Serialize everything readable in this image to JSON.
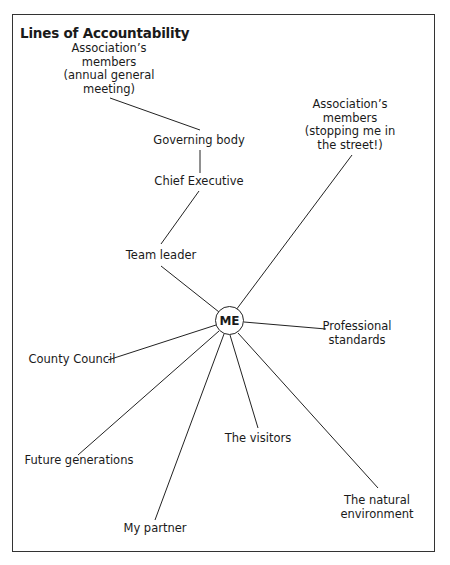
{
  "diagram": {
    "title": "Lines of Accountability",
    "center": "ME",
    "nodes": {
      "agm": [
        "Association’s",
        "members",
        "(annual general",
        "meeting)"
      ],
      "governing_body": "Governing body",
      "chief_executive": "Chief Executive",
      "team_leader": "Team leader",
      "street": [
        "Association’s",
        "members",
        "(stopping me in",
        "the street!)"
      ],
      "professional": [
        "Professional",
        "standards"
      ],
      "county_council": "County Council",
      "future": "Future generations",
      "partner": "My partner",
      "visitors": "The visitors",
      "natural": [
        "The natural",
        "environment"
      ]
    },
    "edges": [
      [
        "agm",
        "governing_body"
      ],
      [
        "governing_body",
        "chief_executive"
      ],
      [
        "chief_executive",
        "team_leader"
      ],
      [
        "team_leader",
        "ME"
      ],
      [
        "street",
        "ME"
      ],
      [
        "professional",
        "ME"
      ],
      [
        "county_council",
        "ME"
      ],
      [
        "future",
        "ME"
      ],
      [
        "partner",
        "ME"
      ],
      [
        "visitors",
        "ME"
      ],
      [
        "natural",
        "ME"
      ]
    ]
  }
}
